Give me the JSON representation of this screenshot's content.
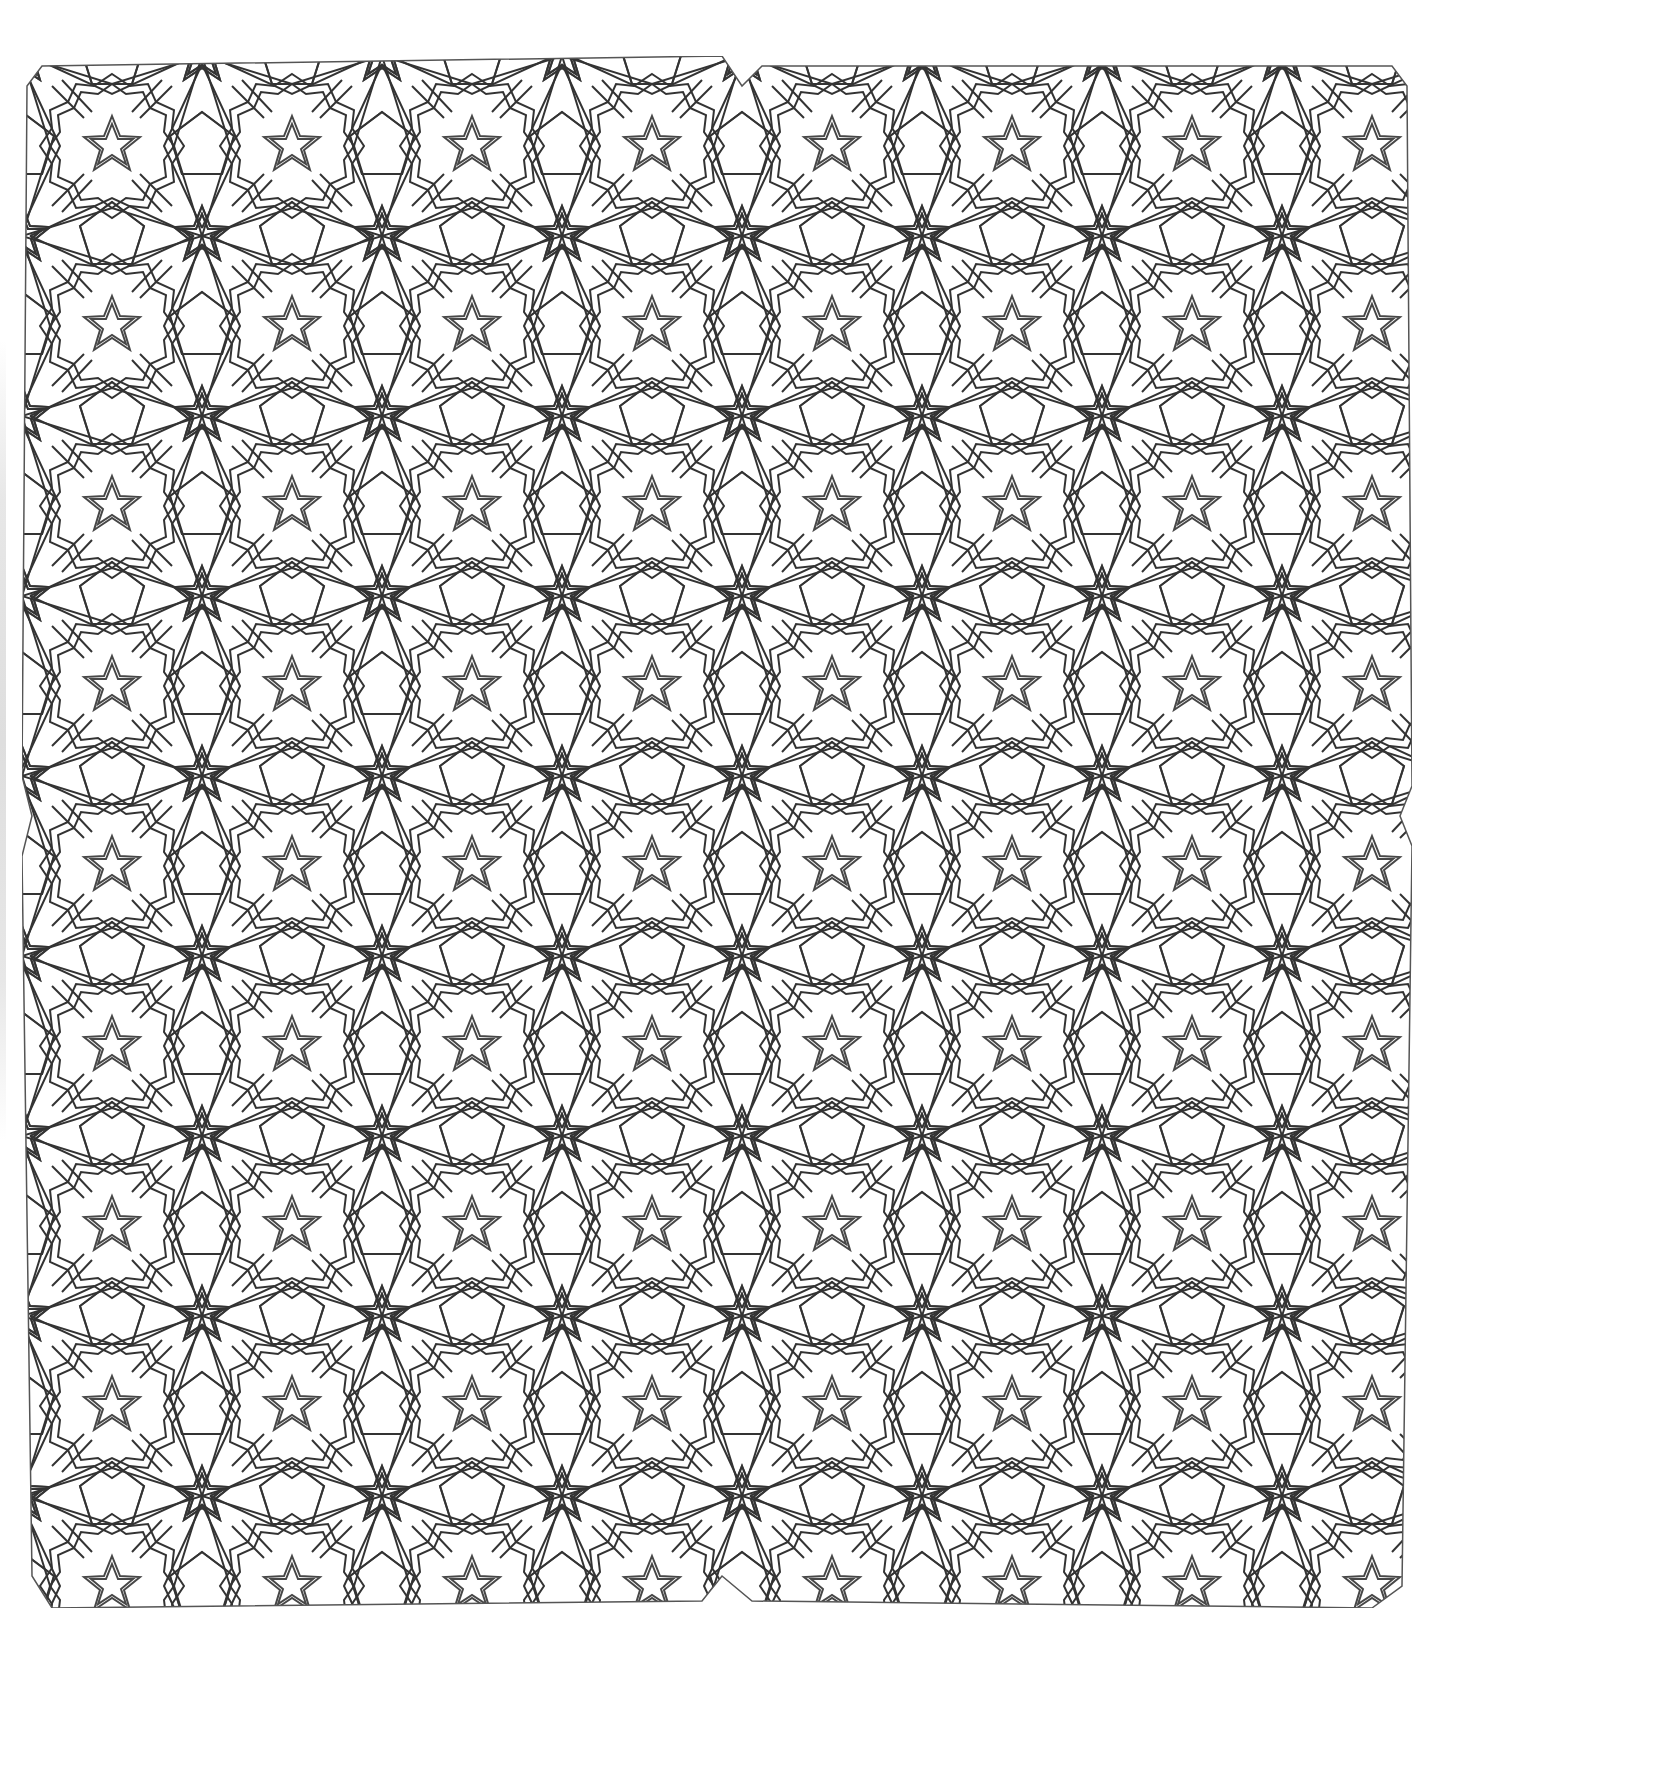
{
  "artwork": {
    "type": "islamic-geometric-pattern",
    "style": "line-art coloring page",
    "motifs": [
      "twelve-point-star",
      "ten-point-star",
      "five-point-star",
      "irregular-pentagon",
      "irregular-hexagon",
      "strapwork-band"
    ],
    "quadrants": 4,
    "colors": {
      "background": "#ffffff",
      "line": "#333333",
      "band_fill": "#ffffff"
    }
  }
}
